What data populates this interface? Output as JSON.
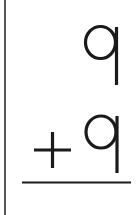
{
  "problem": {
    "operation": "addition",
    "top_number": "9",
    "operator": "+",
    "bottom_number": "9",
    "answer": ""
  },
  "colors": {
    "ink": "#1a1a1a",
    "border": "#555555",
    "background": "#ffffff"
  }
}
